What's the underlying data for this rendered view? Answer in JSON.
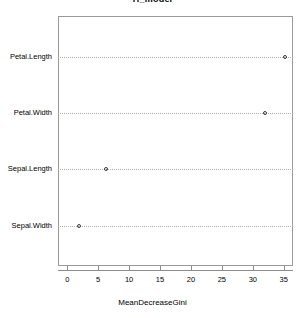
{
  "chart_data": {
    "type": "scatter",
    "title": "rf_model",
    "xlabel": "MeanDecreaseGini",
    "ylabel": "",
    "categories": [
      "Petal.Length",
      "Petal.Width",
      "Sepal.Length",
      "Sepal.Width"
    ],
    "values": [
      35.2,
      31.9,
      6.3,
      1.9
    ],
    "xlim": [
      -1.5,
      36.5
    ],
    "xticks": [
      0,
      5,
      10,
      15,
      20,
      25,
      30,
      35
    ],
    "xtick_labels": [
      "0",
      "5",
      "10",
      "15",
      "20",
      "25",
      "30",
      "35"
    ],
    "grid": "horizontal-dotted",
    "legend": "none",
    "marker": "open-circle"
  },
  "axis": {
    "x_title": "MeanDecreaseGini"
  },
  "title": {
    "text": "rf_model"
  },
  "categories": [
    {
      "label": "Petal.Length",
      "value": 35.2
    },
    {
      "label": "Petal.Width",
      "value": 31.9
    },
    {
      "label": "Sepal.Length",
      "value": 6.3
    },
    {
      "label": "Sepal.Width",
      "value": 1.9
    }
  ],
  "colors": {
    "point_stroke": "#3a3a3a",
    "gridline": "#b0b0b0",
    "axis": "#8c8c8c",
    "panel_border": "#9a9a9a",
    "text": "#000000",
    "background": "#ffffff"
  }
}
